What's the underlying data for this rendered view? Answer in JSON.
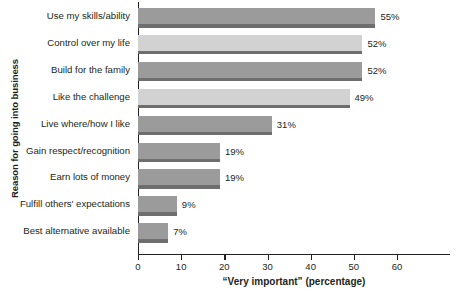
{
  "chart_data": {
    "type": "bar",
    "orientation": "horizontal",
    "title": "",
    "xlabel": "“Very important” (percentage)",
    "ylabel": "Reason for going into business",
    "categories": [
      "Use my skills/ability",
      "Control over my life",
      "Build for the family",
      "Like the challenge",
      "Live where/how I like",
      "Gain respect/recognition",
      "Earn lots of money",
      "Fulfill others' expectations",
      "Best alternative available"
    ],
    "values": [
      55,
      52,
      52,
      49,
      31,
      19,
      19,
      9,
      7
    ],
    "value_labels": [
      "55%",
      "52%",
      "52%",
      "49%",
      "31%",
      "19%",
      "19%",
      "9%",
      "7%"
    ],
    "bar_colors": [
      "#9b9b9b",
      "#d2d2d2",
      "#9b9b9b",
      "#d2d2d2",
      "#9b9b9b",
      "#9b9b9b",
      "#9b9b9b",
      "#9b9b9b",
      "#9b9b9b"
    ],
    "bar_shadow_color": "#6e6e6e",
    "xlim": [
      0,
      60
    ],
    "xticks": [
      0,
      10,
      20,
      30,
      40,
      50,
      60
    ],
    "xtick_labels": [
      "0",
      "10",
      "20",
      "30",
      "40",
      "50",
      "60"
    ],
    "grid": false,
    "legend": "none",
    "axis_color": "#231f20"
  }
}
